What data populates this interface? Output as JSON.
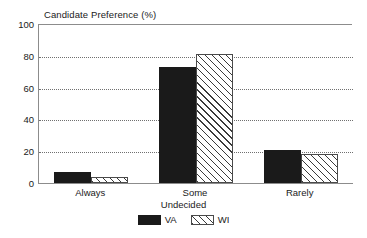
{
  "chart_data": {
    "type": "bar",
    "title": "Candidate Preference (%)",
    "xlabel": "Undecided",
    "ylabel": "",
    "categories": [
      "Always",
      "Some",
      "Rarely"
    ],
    "series": [
      {
        "name": "VA",
        "values": [
          7,
          73,
          21
        ],
        "color": "#1a1a1a",
        "fill": "solid"
      },
      {
        "name": "WI",
        "values": [
          4,
          81,
          18
        ],
        "color": "#3a3a3a",
        "fill": "diagonal-hatch"
      }
    ],
    "ylim": [
      0,
      100
    ],
    "yticks": [
      0,
      20,
      40,
      60,
      80,
      100
    ],
    "ytick_labels": [
      "0",
      "20",
      "40",
      "60",
      "80",
      "100"
    ],
    "gridlines": {
      "horizontal": true,
      "style": "dotted",
      "at": [
        20,
        40,
        60,
        80
      ]
    },
    "legend": {
      "position": "bottom-center",
      "entries": [
        "VA",
        "WI"
      ]
    },
    "axis_style": {
      "spines": [
        "left",
        "top",
        "bottom"
      ],
      "color": "#8c8c8c"
    }
  }
}
